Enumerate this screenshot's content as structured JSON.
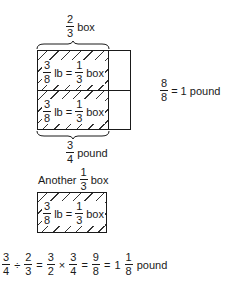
{
  "top_label": {
    "num": "2",
    "den": "3",
    "unit": "box"
  },
  "box_rows": [
    {
      "num": "3",
      "den": "8",
      "unit": "lb",
      "eq": "=",
      "num2": "1",
      "den2": "3",
      "unit2": "box"
    },
    {
      "num": "3",
      "den": "8",
      "unit": "lb",
      "eq": "=",
      "num2": "1",
      "den2": "3",
      "unit2": "box"
    }
  ],
  "right_label": {
    "num": "8",
    "den": "8",
    "text": "= 1 pound"
  },
  "bottom_label": {
    "num": "3",
    "den": "4",
    "unit": "pound"
  },
  "another_label": {
    "prefix": "Another",
    "num": "1",
    "den": "3",
    "unit": "box"
  },
  "another_box": {
    "num": "3",
    "den": "8",
    "unit": "lb",
    "eq": "=",
    "num2": "1",
    "den2": "3",
    "unit2": "box"
  },
  "equation": {
    "a_num": "3",
    "a_den": "4",
    "div": "÷",
    "b_num": "2",
    "b_den": "3",
    "eq1": "=",
    "c_num": "3",
    "c_den": "2",
    "times": "×",
    "d_num": "3",
    "d_den": "4",
    "eq2": "=",
    "e_num": "9",
    "e_den": "8",
    "eq3": "=",
    "whole": "1",
    "f_num": "1",
    "f_den": "8",
    "unit": "pound"
  }
}
